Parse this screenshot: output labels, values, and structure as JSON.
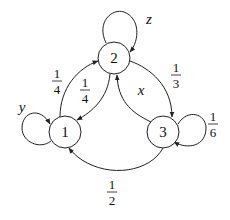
{
  "diagram": {
    "type": "markov-chain-state-diagram",
    "nodes": [
      {
        "id": "1",
        "label": "1"
      },
      {
        "id": "2",
        "label": "2"
      },
      {
        "id": "3",
        "label": "3"
      }
    ],
    "edges": [
      {
        "from": "1",
        "to": "1",
        "label": "y"
      },
      {
        "from": "1",
        "to": "2",
        "num": "1",
        "den": "4"
      },
      {
        "from": "2",
        "to": "1",
        "num": "1",
        "den": "4"
      },
      {
        "from": "2",
        "to": "2",
        "label": "z"
      },
      {
        "from": "2",
        "to": "3",
        "num": "1",
        "den": "3"
      },
      {
        "from": "3",
        "to": "2",
        "label": "x"
      },
      {
        "from": "3",
        "to": "3",
        "num": "1",
        "den": "6"
      },
      {
        "from": "3",
        "to": "1",
        "num": "1",
        "den": "2"
      }
    ]
  },
  "labels": {
    "node1": "1",
    "node2": "2",
    "node3": "3",
    "loop1": "y",
    "loop2": "z",
    "e32": "x",
    "e12_num": "1",
    "e12_den": "4",
    "e21_num": "1",
    "e21_den": "4",
    "e23_num": "1",
    "e23_den": "3",
    "e33_num": "1",
    "e33_den": "6",
    "e31_num": "1",
    "e31_den": "2"
  }
}
